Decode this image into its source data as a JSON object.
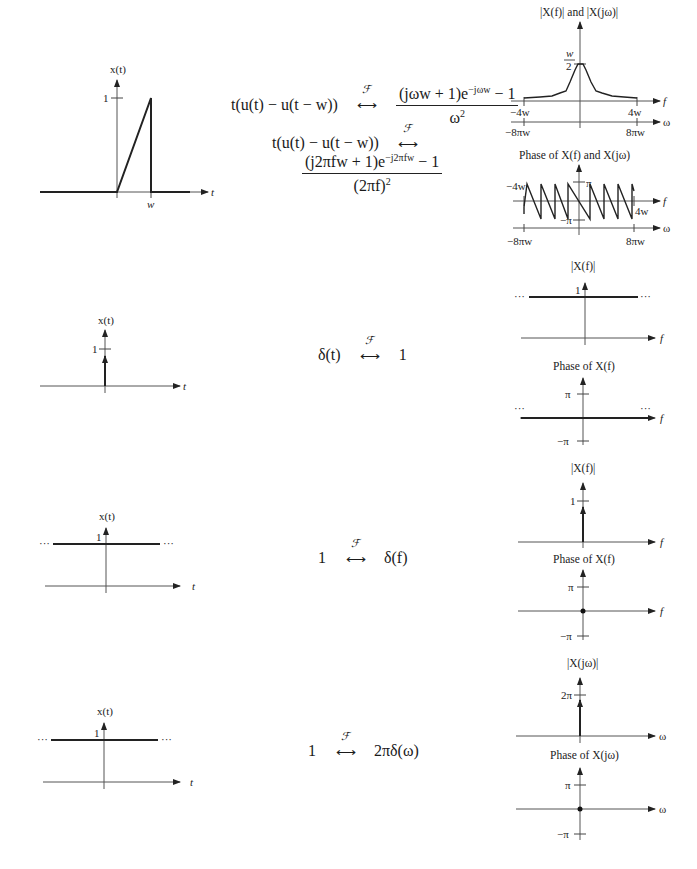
{
  "rows": [
    {
      "id": "ramp-pulse",
      "time_plot": {
        "title": "x(t)",
        "y_tick": "1",
        "x_tick": "w",
        "x_axis_label": "t",
        "shape": "ramp from 0 to 1 over [0,w], then drop to 0"
      },
      "equations": {
        "omega_lhs": "t(u(t) − u(t − w))",
        "omega_num": "(jωw + 1)e",
        "omega_num_exp": "−jωw",
        "omega_num_tail": " − 1",
        "omega_den": "ω",
        "omega_den_exp": "2",
        "f_lhs": "t(u(t) − u(t − w))",
        "f_num": "(j2πfw + 1)e",
        "f_num_exp": "−j2πfw",
        "f_num_tail": " − 1",
        "f_den": "(2πf)",
        "f_den_exp": "2",
        "transform_symbol": "ℱ"
      },
      "magnitude_plot": {
        "title": "|X(f)| and |X(jω)|",
        "y_tick_num": "w",
        "y_tick_den": "2",
        "f_ticks": [
          "−4w",
          "4w"
        ],
        "omega_ticks": [
          "−8πw",
          "8πw"
        ],
        "f_axis_label": "f",
        "omega_axis_label": "ω"
      },
      "phase_plot": {
        "title": "Phase of X(f) and X(jω)",
        "y_ticks": [
          "π",
          "−π"
        ],
        "f_ticks": [
          "−4w",
          "4w"
        ],
        "omega_ticks": [
          "−8πw",
          "8πw"
        ],
        "f_axis_label": "f",
        "omega_axis_label": "ω"
      }
    },
    {
      "id": "impulse",
      "time_plot": {
        "title": "x(t)",
        "y_tick": "1",
        "x_axis_label": "t",
        "shape": "unit impulse at t=0"
      },
      "equation": {
        "lhs": "δ(t)",
        "rhs": "1",
        "transform_symbol": "ℱ"
      },
      "magnitude_plot": {
        "title": "|X(f)|",
        "y_tick": "1",
        "x_axis_label": "f",
        "ellipsis": "···",
        "shape": "constant 1"
      },
      "phase_plot": {
        "title": "Phase of X(f)",
        "y_ticks": [
          "π",
          "−π"
        ],
        "x_axis_label": "f",
        "ellipsis": "···",
        "shape": "constant 0"
      }
    },
    {
      "id": "constant-f",
      "time_plot": {
        "title": "x(t)",
        "y_tick": "1",
        "x_axis_label": "t",
        "ellipsis": "···",
        "shape": "constant 1"
      },
      "equation": {
        "lhs": "1",
        "rhs": "δ(f)",
        "transform_symbol": "ℱ"
      },
      "magnitude_plot": {
        "title": "|X(f)|",
        "y_tick": "1",
        "x_axis_label": "f",
        "shape": "unit impulse at f=0"
      },
      "phase_plot": {
        "title": "Phase of X(f)",
        "y_ticks": [
          "π",
          "−π"
        ],
        "x_axis_label": "f",
        "shape": "zero at f=0 (dot)"
      }
    },
    {
      "id": "constant-omega",
      "time_plot": {
        "title": "x(t)",
        "y_tick": "1",
        "x_axis_label": "t",
        "ellipsis": "···",
        "shape": "constant 1"
      },
      "equation": {
        "lhs": "1",
        "rhs": "2πδ(ω)",
        "transform_symbol": "ℱ"
      },
      "magnitude_plot": {
        "title": "|X(jω)|",
        "y_tick": "2π",
        "x_axis_label": "ω",
        "shape": "impulse of strength 2π at ω=0"
      },
      "phase_plot": {
        "title": "Phase of X(jω)",
        "y_ticks": [
          "π",
          "−π"
        ],
        "x_axis_label": "ω",
        "shape": "zero at ω=0 (dot)"
      }
    }
  ]
}
